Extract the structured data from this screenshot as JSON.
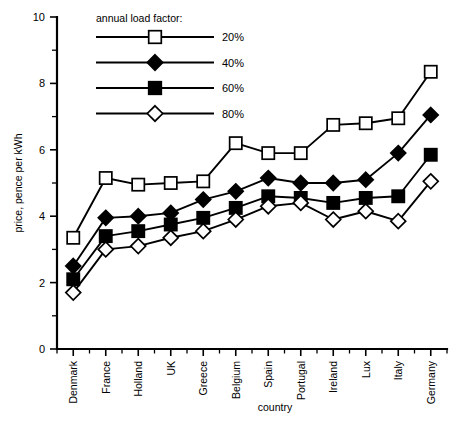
{
  "chart_data": {
    "type": "line",
    "title": "",
    "xlabel": "country",
    "ylabel": "price, pence per kWh",
    "categories": [
      "Denmark",
      "France",
      "Holland",
      "UK",
      "Greece",
      "Belgium",
      "Spain",
      "Portugal",
      "Ireland",
      "Lux",
      "Italy",
      "Germany"
    ],
    "ylim": [
      0,
      10
    ],
    "yticks": [
      0,
      2,
      4,
      6,
      8,
      10
    ],
    "ytick_labels": [
      "0",
      "2",
      "4",
      "6",
      "8",
      "10"
    ],
    "yminor_step": 1,
    "grid": false,
    "legend_position": "top-left-inside",
    "legend_title": "annual load factor:",
    "series": [
      {
        "name": "20%",
        "marker": "open-square",
        "color": "#000000",
        "values": [
          3.35,
          5.15,
          4.95,
          5.0,
          5.05,
          6.2,
          5.9,
          5.9,
          6.75,
          6.8,
          6.95,
          8.35
        ]
      },
      {
        "name": "40%",
        "marker": "filled-diamond",
        "color": "#000000",
        "values": [
          2.5,
          3.95,
          4.0,
          4.1,
          4.5,
          4.75,
          5.15,
          5.0,
          5.0,
          5.1,
          5.9,
          7.05
        ]
      },
      {
        "name": "60%",
        "marker": "filled-square",
        "color": "#000000",
        "values": [
          2.1,
          3.4,
          3.55,
          3.75,
          3.95,
          4.25,
          4.6,
          4.55,
          4.4,
          4.55,
          4.6,
          5.85
        ]
      },
      {
        "name": "80%",
        "marker": "open-diamond",
        "color": "#000000",
        "values": [
          1.7,
          3.0,
          3.1,
          3.35,
          3.55,
          3.9,
          4.3,
          4.4,
          3.9,
          4.15,
          3.85,
          5.05
        ]
      }
    ]
  },
  "legend": {
    "title": "annual load factor:",
    "entries": [
      {
        "label": "20%",
        "marker": "open-square"
      },
      {
        "label": "40%",
        "marker": "filled-diamond"
      },
      {
        "label": "60%",
        "marker": "filled-square"
      },
      {
        "label": "80%",
        "marker": "open-diamond"
      }
    ]
  },
  "axes": {
    "y_title": "price, pence per kWh",
    "x_title": "country"
  }
}
